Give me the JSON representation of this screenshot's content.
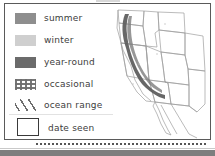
{
  "figure": {
    "kind": "map-legend-figure",
    "background_color": "#ffffff",
    "border_color": "#5a5a5a"
  },
  "legend": {
    "title": "",
    "items": [
      {
        "id": "summer",
        "label": "summer",
        "symbol": "solid-swatch",
        "color": "#8e8e8e"
      },
      {
        "id": "winter",
        "label": "winter",
        "symbol": "solid-swatch",
        "color": "#cfcfcf"
      },
      {
        "id": "year-round",
        "label": "year-round",
        "symbol": "solid-swatch",
        "color": "#6b6b6b"
      },
      {
        "id": "occasional",
        "label": "occasional",
        "symbol": "dotted-swatch",
        "color": "#6e6e6e"
      },
      {
        "id": "ocean-range",
        "label": "ocean range",
        "symbol": "hatch-swatch",
        "color": "#6e6e6e"
      }
    ],
    "footer_item": {
      "id": "date-seen",
      "label": "date seen",
      "symbol": "outlined-box",
      "color": "#3a3a3a"
    }
  },
  "map": {
    "name": "western-united-states-map",
    "region": "Western United States and Baja California",
    "outline_color": "#9a9a9a",
    "range_band_color": "#5f5f5f",
    "range_band_description": "dark band along the California coast and Sierra Nevada"
  },
  "decorations": {
    "dotted_rule": "dotted horizontal rule beneath the legend and map",
    "bottom_bar_color": "#7e7e7e"
  }
}
